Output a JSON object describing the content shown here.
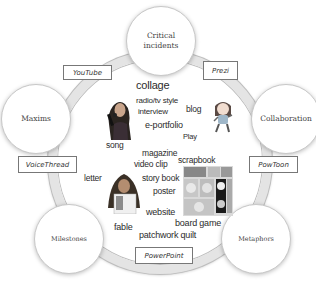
{
  "diagram": {
    "center_ring": "media formats",
    "nodes": [
      {
        "id": "critical-incidents",
        "label_line1": "Critical",
        "label_line2": "incidents"
      },
      {
        "id": "maxims",
        "label_line1": "Maxims"
      },
      {
        "id": "collaboration",
        "label_line1": "Collaboration"
      },
      {
        "id": "milestones",
        "label_line1": "Milestones"
      },
      {
        "id": "metaphors",
        "label_line1": "Metaphors"
      }
    ],
    "tools": [
      {
        "id": "youtube",
        "label": "YouTube"
      },
      {
        "id": "prezi",
        "label": "Prezi"
      },
      {
        "id": "voicethread",
        "label": "VoiceThread"
      },
      {
        "id": "powtoon",
        "label": "PowToon"
      },
      {
        "id": "powerpoint",
        "label": "PowerPoint"
      }
    ],
    "words": [
      "collage",
      "radio/tv style",
      "interview",
      "blog",
      "e-portfolio",
      "Play",
      "song",
      "magazine",
      "video clip",
      "scrapbook",
      "letter",
      "story book",
      "poster",
      "website",
      "board game",
      "fable",
      "patchwork quilt"
    ],
    "images": [
      {
        "id": "singer-photo",
        "description": "woman singing into microphone"
      },
      {
        "id": "cartoon-girl",
        "description": "cartoon girl character"
      },
      {
        "id": "teacher-photo",
        "description": "woman in headscarf holding book"
      },
      {
        "id": "board-game-photo",
        "description": "board game made of tiles"
      }
    ]
  }
}
